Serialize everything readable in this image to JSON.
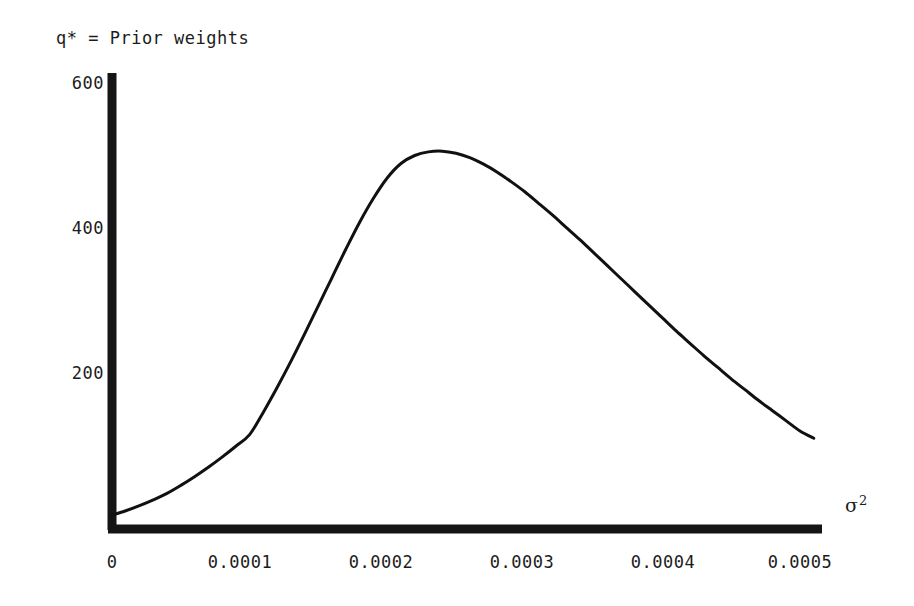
{
  "figure": {
    "title": "q* = Prior weights",
    "background_color": "#ffffff",
    "ink_color": "#1a1a1a"
  },
  "axes": {
    "x_axis_title_symbol": "σ",
    "x_axis_title_exponent": "2",
    "y_tick_labels": [
      "600",
      "400",
      "200"
    ],
    "x_tick_labels": [
      "0",
      "0.0001",
      "0.0002",
      "0.0003",
      "0.0004",
      "0.0005"
    ]
  },
  "chart_data": {
    "type": "line",
    "title": "q* = Prior weights",
    "xlabel": "σ²",
    "ylabel": "q* = Prior weights",
    "xlim": [
      0,
      0.000517
    ],
    "ylim": [
      0,
      615
    ],
    "grid": false,
    "legend": null,
    "xticks": [
      0,
      0.0001,
      0.0002,
      0.0003,
      0.0004,
      0.0005
    ],
    "xtick_labels": [
      "0",
      "0.0001",
      "0.0002",
      "0.0003",
      "0.0004",
      "0.0005"
    ],
    "yticks": [
      200,
      400,
      600
    ],
    "ytick_labels": [
      "200",
      "400",
      "600"
    ],
    "series": [
      {
        "name": "q* = Prior weights",
        "color": "#111111",
        "line_width": 3,
        "x": [
          0.0,
          1e-05,
          2e-05,
          3e-05,
          4e-05,
          5e-05,
          6e-05,
          7e-05,
          8e-05,
          9e-05,
          0.0001,
          0.00011,
          0.00012,
          0.00013,
          0.00014,
          0.00015,
          0.00016,
          0.00017,
          0.00018,
          0.00019,
          0.0002,
          0.00021,
          0.00022,
          0.00023,
          0.00024,
          0.00025,
          0.00026,
          0.00027,
          0.00028,
          0.00029,
          0.0003,
          0.00031,
          0.00032,
          0.00033,
          0.00034,
          0.00035,
          0.00036,
          0.00037,
          0.00038,
          0.00039,
          0.0004,
          0.00041,
          0.00042,
          0.00043,
          0.00044,
          0.00045,
          0.00046,
          0.00047,
          0.00048,
          0.00049,
          0.0005,
          0.00051
        ],
        "y": [
          4,
          10,
          17,
          25,
          34,
          45,
          57,
          70,
          84,
          99,
          115,
          146,
          180,
          216,
          254,
          293,
          332,
          371,
          408,
          441,
          469,
          489,
          500,
          505,
          506,
          503,
          497,
          488,
          477,
          464,
          450,
          434,
          418,
          401,
          384,
          366,
          348,
          330,
          312,
          294,
          276,
          258,
          241,
          224,
          208,
          192,
          177,
          162,
          148,
          134,
          120,
          110
        ],
        "peak": {
          "x": 0.00025,
          "y": 506
        },
        "start": {
          "x": 0.0,
          "y": 0
        },
        "end": {
          "x": 0.000515,
          "y": 105
        }
      }
    ]
  }
}
